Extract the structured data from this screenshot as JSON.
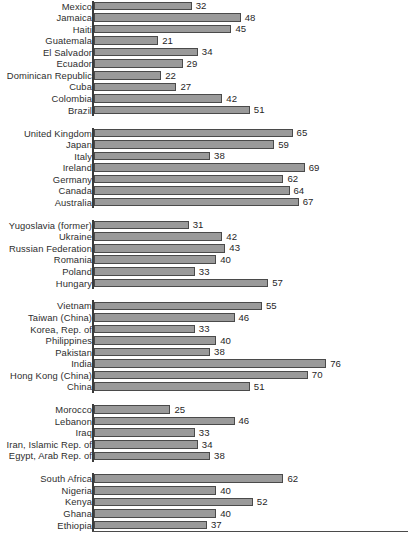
{
  "chart_data": {
    "type": "bar",
    "orientation": "horizontal",
    "title": "",
    "subtitle": "",
    "xlabel": "",
    "ylabel": "",
    "xlim": [
      0,
      80
    ],
    "grid": false,
    "legend": null,
    "value_label_position": "outside-right",
    "bar_color": "#9a9a9a",
    "bar_border_color": "#4a4a4a",
    "axis_color": "#3b3b3b",
    "groups": [
      {
        "name": "Latin America and the Caribbean",
        "categories": [
          "Mexico",
          "Jamaica",
          "Haiti",
          "Guatemala",
          "El Salvador",
          "Ecuador",
          "Dominican Republic",
          "Cuba",
          "Colombia",
          "Brazil"
        ],
        "values": [
          32,
          48,
          45,
          21,
          34,
          29,
          22,
          27,
          42,
          51
        ]
      },
      {
        "name": "High income",
        "categories": [
          "United Kingdom",
          "Japan",
          "Italy",
          "Ireland",
          "Germany",
          "Canada",
          "Australia"
        ],
        "values": [
          65,
          59,
          38,
          69,
          62,
          64,
          67
        ]
      },
      {
        "name": "Europe and Central Asia",
        "categories": [
          "Yugoslavia (former)",
          "Ukraine",
          "Russian Federation",
          "Romania",
          "Poland",
          "Hungary"
        ],
        "values": [
          31,
          42,
          43,
          40,
          33,
          57
        ]
      },
      {
        "name": "East and South Asia",
        "categories": [
          "Vietnam",
          "Taiwan (China)",
          "Korea, Rep. of",
          "Philippines",
          "Pakistan",
          "India",
          "Hong Kong (China)",
          "China"
        ],
        "values": [
          55,
          46,
          33,
          40,
          38,
          76,
          70,
          51
        ]
      },
      {
        "name": "Middle East and North Africa",
        "categories": [
          "Morocco",
          "Lebanon",
          "Iraq",
          "Iran, Islamic Rep. of",
          "Egypt, Arab Rep. of"
        ],
        "values": [
          25,
          46,
          33,
          34,
          38
        ]
      },
      {
        "name": "Sub-Saharan Africa",
        "categories": [
          "South Africa",
          "Nigeria",
          "Kenya",
          "Ghana",
          "Ethiopia"
        ],
        "values": [
          62,
          40,
          52,
          40,
          37
        ]
      }
    ]
  }
}
